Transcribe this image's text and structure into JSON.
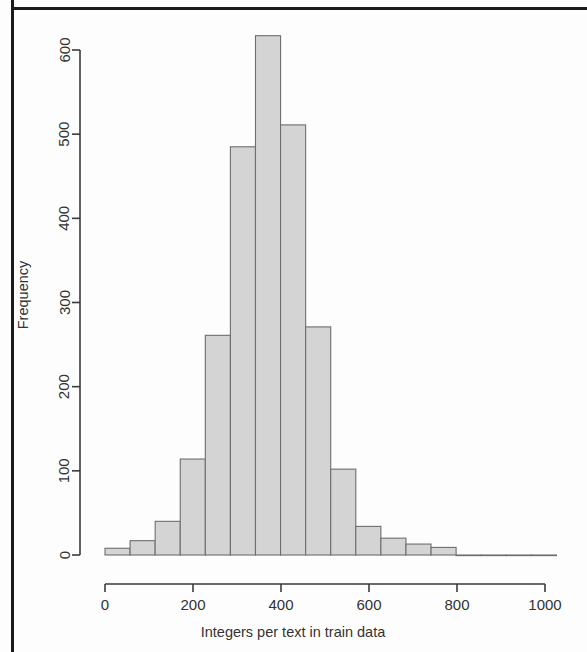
{
  "figure": {
    "kind": "histogram-figure",
    "background_color": "#fdfdfd",
    "frame_color": "#1b1b1b"
  },
  "chart_data": {
    "type": "bar",
    "subtype": "histogram",
    "title": "",
    "subtitle": "",
    "xlabel": "Integers per text in train data",
    "ylabel": "Frequency",
    "xlim": [
      0,
      1060
    ],
    "ylim": [
      0,
      640
    ],
    "xticks": [
      0,
      200,
      400,
      600,
      800,
      1000
    ],
    "xtick_labels": [
      "0",
      "200",
      "400",
      "600",
      "800",
      "1000"
    ],
    "yticks": [
      0,
      100,
      200,
      300,
      400,
      500,
      600
    ],
    "ytick_labels": [
      "0",
      "100",
      "200",
      "300",
      "400",
      "500",
      "600"
    ],
    "grid": false,
    "legend": false,
    "legend_position": "none",
    "bin_width": 57,
    "bin_starts": [
      0,
      57,
      114,
      171,
      228,
      285,
      342,
      399,
      456,
      513,
      570,
      627,
      684,
      741,
      798,
      855,
      912,
      969
    ],
    "bin_centers": [
      28,
      85,
      142,
      199,
      256,
      313,
      370,
      427,
      484,
      541,
      598,
      655,
      712,
      769,
      826,
      883,
      940,
      997
    ],
    "values": [
      8,
      17,
      40,
      114,
      261,
      485,
      617,
      511,
      271,
      102,
      34,
      20,
      13,
      9,
      0,
      0,
      0,
      0
    ],
    "bar_fill_color": "#d4d4d4",
    "bar_edge_color": "#6e6e6e",
    "axis_color": "#3a3a3a",
    "peak_value": 617,
    "peak_bin_center": 370
  }
}
